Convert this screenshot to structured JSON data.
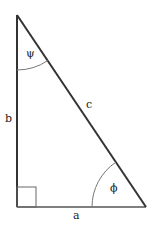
{
  "diagram": {
    "type": "right-triangle",
    "vertices": {
      "top": [
        17,
        15
      ],
      "bottom_left": [
        17,
        207
      ],
      "bottom_right": [
        146,
        207
      ]
    },
    "sides": {
      "a": "a",
      "b": "b",
      "c": "c"
    },
    "angles": {
      "top": "ψ",
      "bottom_right": "ϕ"
    },
    "colors": {
      "stroke": "#333333",
      "arc": "#777777",
      "text": "#222222"
    }
  }
}
